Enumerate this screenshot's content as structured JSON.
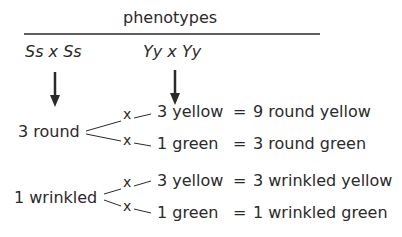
{
  "header": {
    "title": "phenotypes"
  },
  "crosses": {
    "left": "Ss x Ss",
    "right": "Yy x Yy"
  },
  "branches": [
    {
      "label": "3 round",
      "rows": [
        {
          "marker": "x",
          "factor": "3 yellow",
          "equals": "=",
          "result": "9 round yellow"
        },
        {
          "marker": "x",
          "factor": "1 green",
          "equals": "=",
          "result": "3 round green"
        }
      ]
    },
    {
      "label": "1 wrinkled",
      "rows": [
        {
          "marker": "x",
          "factor": "3 yellow",
          "equals": "=",
          "result": "3 wrinkled yellow"
        },
        {
          "marker": "x",
          "factor": "1 green",
          "equals": "=",
          "result": "1 wrinkled green"
        }
      ]
    }
  ],
  "colors": {
    "ink": "#2a2a2a",
    "background": "#ffffff"
  }
}
